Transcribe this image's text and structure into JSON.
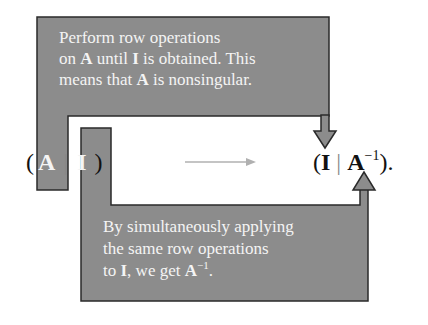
{
  "diagram": {
    "top_callout": {
      "lines": [
        {
          "text": "Perform row operations"
        },
        {
          "pre": "on ",
          "bold1": "A",
          "mid": " until ",
          "bold2": "I",
          "post": " is obtained. This"
        },
        {
          "pre": "means that ",
          "bold1": "A",
          "post": " is nonsingular."
        }
      ]
    },
    "bottom_callout": {
      "lines": [
        {
          "text": "By simultaneously applying"
        },
        {
          "text": "the same row operations"
        },
        {
          "pre": "to ",
          "bold1": "I",
          "mid": ", we get ",
          "bold2": "A",
          "sup": "−1",
          "post": "."
        }
      ]
    },
    "left_formula": {
      "open_paren": "(",
      "matrix_a": "A",
      "separator": "|",
      "matrix_i": "I",
      "close_paren": ")"
    },
    "right_formula": {
      "open_paren": "(",
      "matrix_i": "I",
      "separator": "|",
      "matrix_a": "A",
      "superscript": "−1",
      "close": ")."
    },
    "colors": {
      "callout_fill": "#8c8c8c",
      "callout_border": "#2a2a2a",
      "callout_text": "#f4f4f4",
      "transition_arrow": "#b0b0b0",
      "formula_text": "#111111"
    }
  }
}
